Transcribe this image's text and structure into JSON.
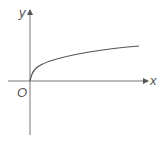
{
  "diagram": {
    "type": "function-graph",
    "labels": {
      "y_axis": "y",
      "x_axis": "x",
      "origin": "O"
    },
    "curve": {
      "description": "increasing concave curve starting at origin (square-root-like)",
      "color": "#555555"
    },
    "axis_color": "#777777"
  }
}
